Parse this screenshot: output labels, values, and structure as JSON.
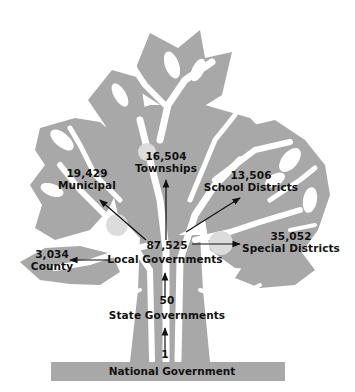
{
  "diagram": {
    "type": "tree-hierarchy",
    "colors": {
      "tree_fill": "#a8a8a8",
      "branch_cutout": "#ffffff",
      "fruit": "#dcdcdc",
      "text": "#111111",
      "arrow": "#111111",
      "base_bar": "#a8a8a8"
    },
    "root": {
      "count": "1",
      "label": "National Government"
    },
    "state": {
      "count": "50",
      "label": "State Governments"
    },
    "local": {
      "count": "87,525",
      "label": "Local Governments"
    },
    "local_children": [
      {
        "id": "townships",
        "count": "16,504",
        "label": "Townships"
      },
      {
        "id": "municipal",
        "count": "19,429",
        "label": "Municipal"
      },
      {
        "id": "school",
        "count": "13,506",
        "label": "School Districts"
      },
      {
        "id": "special",
        "count": "35,052",
        "label": "Special Districts"
      },
      {
        "id": "county",
        "count": "3,034",
        "label": "County"
      }
    ]
  }
}
